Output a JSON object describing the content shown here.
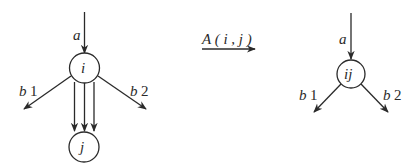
{
  "left_graph": {
    "nodes": [
      {
        "id": "i",
        "label": "i"
      },
      {
        "id": "j",
        "label": "j"
      }
    ],
    "edges": [
      {
        "label": "a",
        "to": "i",
        "direction": "incoming"
      },
      {
        "label": "b 1",
        "from": "i",
        "direction": "outgoing-left"
      },
      {
        "label": "b 2",
        "from": "i",
        "direction": "outgoing-right"
      },
      {
        "from": "i",
        "to": "j",
        "count": 3
      }
    ],
    "labels": {
      "a": "a",
      "b1": "b",
      "b1_idx": "1",
      "b2": "b",
      "b2_idx": "2",
      "i": "i",
      "j": "j"
    }
  },
  "transformation": {
    "label": "A ( i , j )"
  },
  "right_graph": {
    "nodes": [
      {
        "id": "ij",
        "label": "ij"
      }
    ],
    "labels": {
      "a": "a",
      "b1": "b",
      "b1_idx": "1",
      "b2": "b",
      "b2_idx": "2",
      "ij": "ij"
    }
  },
  "colors": {
    "stroke": "#2a2a2a",
    "background": "#ffffff"
  }
}
